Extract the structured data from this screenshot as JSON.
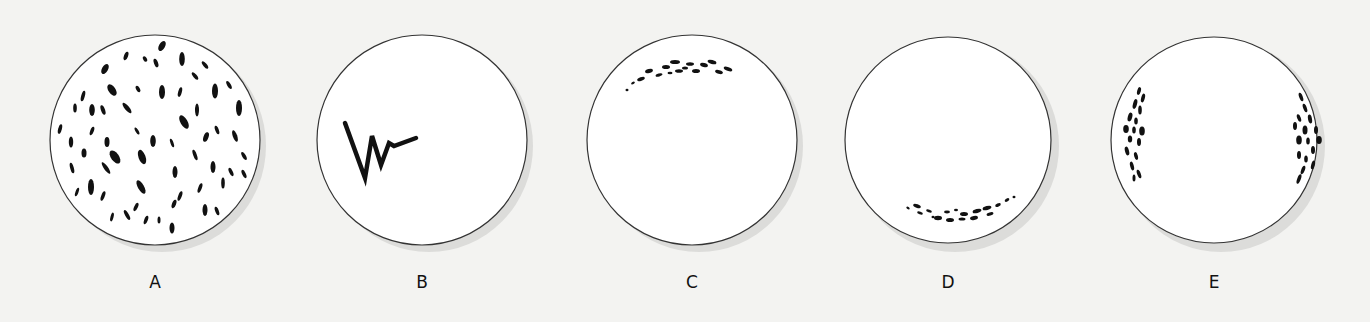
{
  "figure": {
    "panels": [
      {
        "id": "A",
        "label": "A",
        "description": "particles scattered randomly throughout field",
        "cx": 155,
        "cy": 140,
        "r": 105
      },
      {
        "id": "B",
        "label": "B",
        "description": "zig-zag line trace on left side of field",
        "cx": 422,
        "cy": 140,
        "r": 105
      },
      {
        "id": "C",
        "label": "C",
        "description": "particles clustered in an arc near top of field",
        "cx": 692,
        "cy": 140,
        "r": 105
      },
      {
        "id": "D",
        "label": "D",
        "description": "particles clustered in an arc near bottom of field",
        "cx": 948,
        "cy": 140,
        "r": 105
      },
      {
        "id": "E",
        "label": "E",
        "description": "particles clustered along left and right edges of field",
        "cx": 1214,
        "cy": 140,
        "r": 105
      }
    ],
    "colors": {
      "background": "#f3f3f1",
      "circle_fill": "#ffffff",
      "circle_stroke": "#333333",
      "particle": "#111111",
      "shadow": "#d8d8d6"
    }
  }
}
